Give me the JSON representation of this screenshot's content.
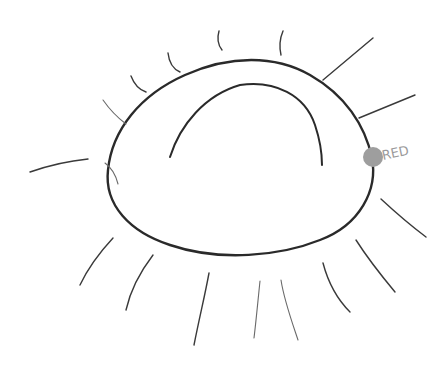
{
  "drawing": {
    "subject": "hand-drawn sun / eye-like oval with radiating lines",
    "background": "#ffffff",
    "ink_color": "#2a2a2a",
    "dot": {
      "color": "#9e9e9e",
      "cx": 373,
      "cy": 157,
      "r": 10
    },
    "annotation": {
      "text": "RED",
      "color": "#9a9a9a"
    },
    "ray_count": 16
  }
}
